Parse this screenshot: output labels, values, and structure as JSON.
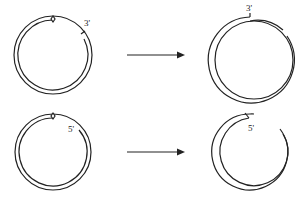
{
  "diagram": {
    "type": "DNA replication circular plasmid diagram",
    "rows": [
      {
        "before": {
          "label": "3'",
          "feature": "nick with 3' end"
        },
        "arrow": "right-arrow",
        "after": {
          "label": "3'",
          "feature": "extended 3' strand overlapping"
        }
      },
      {
        "before": {
          "label": "5'",
          "feature": "nick with 5' end"
        },
        "arrow": "right-arrow",
        "after": {
          "label": "5'",
          "feature": "displaced 5' strand"
        }
      }
    ]
  }
}
